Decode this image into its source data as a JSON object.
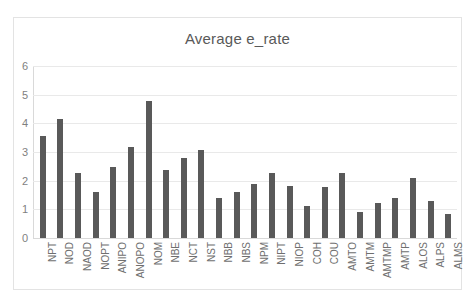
{
  "chart_data": {
    "type": "bar",
    "title": "Average e_rate",
    "xlabel": "",
    "ylabel": "",
    "ylim": [
      0,
      6
    ],
    "yticks": [
      0,
      1,
      2,
      3,
      4,
      5,
      6
    ],
    "grid": true,
    "legend": false,
    "bar_color": "#595959",
    "categories": [
      "NPT",
      "NOD",
      "NAOD",
      "NOPT",
      "ANIPO",
      "ANOPO",
      "NOM",
      "NBE",
      "NCT",
      "NST",
      "NBB",
      "NBS",
      "NPM",
      "NIPT",
      "NIOP",
      "COH",
      "COU",
      "AMTO",
      "AMTM",
      "AMTMP",
      "AMTP",
      "ALOS",
      "ALPS",
      "ALMS"
    ],
    "values": [
      3.55,
      4.15,
      2.27,
      1.6,
      2.46,
      3.17,
      4.78,
      2.38,
      2.8,
      3.08,
      1.41,
      1.6,
      1.89,
      2.27,
      1.8,
      1.11,
      1.79,
      2.28,
      0.92,
      1.21,
      1.41,
      2.09,
      1.3,
      0.84
    ]
  }
}
